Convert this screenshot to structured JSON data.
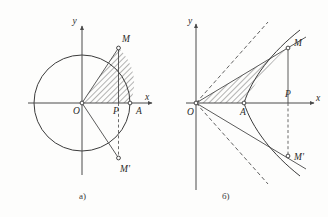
{
  "figure": {
    "title": "",
    "background_color": "#fdfdfc",
    "ink_color": "#3b3b3b",
    "panels": [
      {
        "id": "a",
        "caption": "a)",
        "curve_type": "circle",
        "description": "Unit circle with radius OA; shaded circular-sector-like region between OA, chord OM and the arc AM; chord OM' mirrored below the x-axis.",
        "axes": {
          "x_label": "x",
          "y_label": "y",
          "origin_label": "O"
        },
        "points": [
          {
            "name": "O",
            "label": "O",
            "x": 0.0,
            "y": 0.0
          },
          {
            "name": "A",
            "label": "A",
            "x": 1.0,
            "y": 0.0
          },
          {
            "name": "P",
            "label": "P",
            "x": 0.76,
            "y": 0.0
          },
          {
            "name": "M",
            "label": "M",
            "x": 0.76,
            "y": 0.65
          },
          {
            "name": "M_prime",
            "label": "M'",
            "x": 0.76,
            "y": -0.65
          }
        ],
        "shaded_region": "sector OAM",
        "dashed_segment": "P to M'",
        "circle_radius_px": 48
      },
      {
        "id": "b",
        "caption": "б)",
        "curve_type": "hyperbola",
        "description": "Right branch of a hyperbola with vertex A, dashed asymptotes through O, shaded hyperbolic sector OAM; ray OM extended and mirrored ray OM'.",
        "axes": {
          "x_label": "x",
          "y_label": "y",
          "origin_label": "O"
        },
        "points": [
          {
            "name": "O",
            "label": "O",
            "x": 0.0,
            "y": 0.0
          },
          {
            "name": "A",
            "label": "A",
            "x": 1.0,
            "y": 0.0
          },
          {
            "name": "P",
            "label": "P",
            "x": 1.9,
            "y": 0.0
          },
          {
            "name": "M",
            "label": "M",
            "x": 1.9,
            "y": 1.15
          },
          {
            "name": "M_prime",
            "label": "M'",
            "x": 1.9,
            "y": -1.15
          }
        ],
        "shaded_region": "hyperbolic sector OAM",
        "dashed_segment": "P to M'",
        "asymptotes": [
          "y = kx",
          "y = -kx"
        ],
        "vertex_x_px": 244
      }
    ]
  }
}
